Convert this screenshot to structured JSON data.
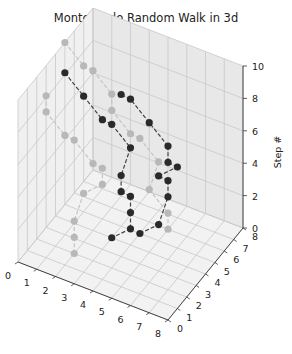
{
  "chart_data": {
    "type": "scatter3d",
    "title": "Monte Carlo Random Walk in 3d",
    "xlabel": "",
    "ylabel": "",
    "zlabel": "Step #",
    "xlim": [
      0,
      8
    ],
    "ylim": [
      0,
      8
    ],
    "zlim": [
      0,
      10
    ],
    "x_ticks": [
      "0",
      "1",
      "2",
      "3",
      "4",
      "5",
      "6",
      "7",
      "8"
    ],
    "y_ticks": [
      "0",
      "1",
      "2",
      "3",
      "4",
      "5",
      "6",
      "7",
      "8"
    ],
    "z_ticks": [
      "0",
      "2",
      "4",
      "6",
      "8",
      "10"
    ],
    "grid": true,
    "line_style": "dashed",
    "marker": "o",
    "series": [
      {
        "name": "walk-1",
        "shade": "dark",
        "x": [
          1,
          2,
          3,
          3,
          4,
          4,
          4,
          4,
          4,
          4,
          3
        ],
        "y": [
          3,
          3,
          3,
          4,
          4,
          3,
          3,
          4,
          4,
          4,
          4
        ],
        "z": [
          10,
          9,
          8,
          7,
          6,
          5,
          4,
          3,
          2,
          1,
          0
        ]
      },
      {
        "name": "walk-2",
        "shade": "dark",
        "x": [
          4,
          5,
          5,
          5,
          5,
          6,
          6,
          6,
          5,
          4,
          4
        ],
        "y": [
          5,
          5,
          6,
          6,
          5,
          5,
          4,
          4,
          4,
          4,
          3
        ],
        "z": [
          0,
          1,
          2,
          3,
          4,
          5,
          6,
          7,
          8,
          9,
          10
        ]
      },
      {
        "name": "walk-3",
        "shade": "light",
        "x": [
          1,
          1,
          2,
          2,
          3,
          3,
          3,
          2,
          2,
          2,
          2
        ],
        "y": [
          1,
          1,
          1,
          2,
          2,
          3,
          3,
          3,
          2,
          2,
          2
        ],
        "z": [
          10,
          9,
          8,
          7,
          6,
          5,
          4,
          3,
          2,
          1,
          0
        ]
      },
      {
        "name": "walk-4",
        "shade": "light",
        "x": [
          0,
          1,
          1,
          2,
          2,
          3,
          3,
          4,
          4,
          5,
          5
        ],
        "y": [
          5,
          5,
          6,
          6,
          6,
          6,
          7,
          7,
          6,
          6,
          6
        ],
        "z": [
          10,
          9,
          8,
          7,
          6,
          5,
          4,
          3,
          2,
          1,
          0
        ]
      }
    ]
  }
}
